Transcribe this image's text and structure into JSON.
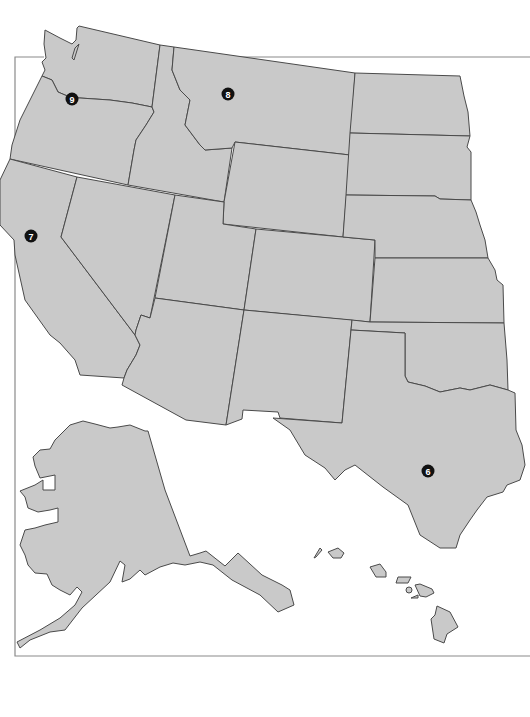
{
  "map": {
    "title": "Western United States",
    "colors": {
      "land": "#c9c9c9",
      "border": "#4a4a4a",
      "frame": "#8a8a8a",
      "marker": "#111111",
      "marker_text": "#ffffff",
      "background": "#ffffff"
    },
    "states": [
      "Washington",
      "Oregon",
      "California",
      "Idaho",
      "Nevada",
      "Montana",
      "Wyoming",
      "Utah",
      "Arizona",
      "Colorado",
      "New Mexico",
      "North Dakota",
      "South Dakota",
      "Nebraska",
      "Kansas",
      "Oklahoma",
      "Texas",
      "Alaska",
      "Hawaii"
    ],
    "markers": [
      {
        "id": "6",
        "label": "6",
        "state": "Texas",
        "x": 428,
        "y": 471
      },
      {
        "id": "7",
        "label": "7",
        "state": "California",
        "x": 31,
        "y": 236
      },
      {
        "id": "8",
        "label": "8",
        "state": "Montana",
        "x": 228,
        "y": 94
      },
      {
        "id": "9",
        "label": "9",
        "state": "Oregon",
        "x": 72,
        "y": 99
      }
    ]
  }
}
